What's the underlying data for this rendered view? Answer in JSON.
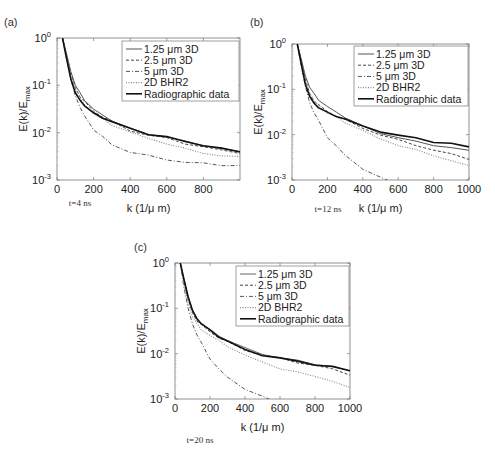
{
  "figure": {
    "panels": [
      {
        "label": "(a)",
        "caption": "t=4 ns"
      },
      {
        "label": "(b)",
        "caption": "t=12 ns"
      },
      {
        "label": "(c)",
        "caption": "t=20 ns"
      }
    ]
  },
  "chart_data": [
    {
      "type": "line",
      "title": "(a)",
      "caption": "t=4 ns",
      "xlabel": "k (1/μ m)",
      "ylabel": "E(k)/E_max",
      "xscale": "linear",
      "yscale": "log",
      "xlim": [
        0,
        1000
      ],
      "ylim": [
        0.001,
        1
      ],
      "xticks": [
        0,
        200,
        400,
        600,
        800
      ],
      "yticks": [
        "10^-3",
        "10^-2",
        "10^-1",
        "10^0"
      ],
      "grid": false,
      "legend_position": "upper right",
      "x": [
        30,
        50,
        75,
        100,
        125,
        150,
        200,
        250,
        300,
        400,
        500,
        600,
        700,
        800,
        900,
        1000
      ],
      "series": [
        {
          "name": "1.25 μm 3D",
          "style": "solid",
          "color": "#555555",
          "values": [
            1.0,
            0.5,
            0.2,
            0.1,
            0.07,
            0.05,
            0.03,
            0.024,
            0.018,
            0.012,
            0.0095,
            0.008,
            0.0065,
            0.0055,
            0.0045,
            0.004
          ]
        },
        {
          "name": "2.5 μm 3D",
          "style": "dashed",
          "color": "#444444",
          "values": [
            1.0,
            0.45,
            0.18,
            0.09,
            0.06,
            0.045,
            0.028,
            0.022,
            0.017,
            0.011,
            0.009,
            0.0075,
            0.006,
            0.005,
            0.0042,
            0.0038
          ]
        },
        {
          "name": "5 μm 3D",
          "style": "dashdot",
          "color": "#555555",
          "values": [
            1.0,
            0.4,
            0.14,
            0.06,
            0.035,
            0.022,
            0.012,
            0.008,
            0.0055,
            0.004,
            0.0032,
            0.0027,
            0.0024,
            0.0022,
            0.0021,
            0.002
          ]
        },
        {
          "name": "2D BHR2",
          "style": "dotted",
          "color": "#888888",
          "values": [
            1.0,
            0.45,
            0.17,
            0.085,
            0.055,
            0.04,
            0.025,
            0.019,
            0.015,
            0.01,
            0.0075,
            0.006,
            0.0045,
            0.0037,
            0.0033,
            0.003
          ]
        },
        {
          "name": "Radiographic data",
          "style": "solid-thick",
          "color": "#111111",
          "values": [
            1.0,
            0.4,
            0.14,
            0.07,
            0.05,
            0.038,
            0.025,
            0.021,
            0.017,
            0.012,
            0.0095,
            0.008,
            0.0065,
            0.0055,
            0.0045,
            0.004
          ]
        }
      ]
    },
    {
      "type": "line",
      "title": "(b)",
      "caption": "t=12 ns",
      "xlabel": "k (1/μ m)",
      "ylabel": "E(k)/E_max",
      "xscale": "linear",
      "yscale": "log",
      "xlim": [
        0,
        1000
      ],
      "ylim": [
        0.001,
        1
      ],
      "xticks": [
        0,
        200,
        400,
        600,
        800,
        1000
      ],
      "yticks": [
        "10^-3",
        "10^-2",
        "10^-1",
        "10^0"
      ],
      "grid": false,
      "legend_position": "upper right",
      "x": [
        30,
        50,
        75,
        100,
        125,
        150,
        200,
        250,
        300,
        400,
        500,
        600,
        700,
        800,
        900,
        1000
      ],
      "series": [
        {
          "name": "1.25 μm 3D",
          "style": "solid",
          "color": "#555555",
          "values": [
            1.0,
            0.5,
            0.2,
            0.11,
            0.08,
            0.06,
            0.04,
            0.032,
            0.024,
            0.015,
            0.011,
            0.0085,
            0.007,
            0.006,
            0.005,
            0.0045
          ]
        },
        {
          "name": "2.5 μm 3D",
          "style": "dashed",
          "color": "#444444",
          "values": [
            1.0,
            0.45,
            0.17,
            0.08,
            0.055,
            0.045,
            0.032,
            0.026,
            0.021,
            0.014,
            0.01,
            0.0075,
            0.006,
            0.0045,
            0.0037,
            0.003
          ]
        },
        {
          "name": "5 μm 3D",
          "style": "dashdot",
          "color": "#555555",
          "values": [
            1.0,
            0.35,
            0.12,
            0.05,
            0.03,
            0.02,
            0.009,
            0.0055,
            0.0035,
            0.0018,
            0.0011,
            0.0008,
            0.0006,
            0.00045,
            0.00035,
            0.0003
          ]
        },
        {
          "name": "2D BHR2",
          "style": "dotted",
          "color": "#888888",
          "values": [
            1.0,
            0.45,
            0.17,
            0.08,
            0.055,
            0.045,
            0.03,
            0.024,
            0.019,
            0.012,
            0.008,
            0.006,
            0.0045,
            0.0035,
            0.0027,
            0.002
          ]
        },
        {
          "name": "Radiographic data",
          "style": "solid-thick",
          "color": "#111111",
          "values": [
            1.0,
            0.4,
            0.13,
            0.07,
            0.05,
            0.04,
            0.03,
            0.026,
            0.022,
            0.015,
            0.012,
            0.0095,
            0.0085,
            0.007,
            0.0062,
            0.0055
          ]
        }
      ]
    },
    {
      "type": "line",
      "title": "(c)",
      "caption": "t=20 ns",
      "xlabel": "k (1/μ m)",
      "ylabel": "E(k)/E_max",
      "xscale": "linear",
      "yscale": "log",
      "xlim": [
        0,
        1000
      ],
      "ylim": [
        0.001,
        1
      ],
      "xticks": [
        0,
        200,
        400,
        600,
        800,
        1000
      ],
      "yticks": [
        "10^-3",
        "10^-2",
        "10^-1",
        "10^0"
      ],
      "grid": false,
      "legend_position": "upper right",
      "x": [
        30,
        50,
        75,
        100,
        125,
        150,
        200,
        250,
        300,
        400,
        500,
        600,
        700,
        800,
        900,
        1000
      ],
      "series": [
        {
          "name": "1.25 μm 3D",
          "style": "solid",
          "color": "#666666",
          "values": [
            1.0,
            0.45,
            0.18,
            0.09,
            0.06,
            0.047,
            0.033,
            0.025,
            0.02,
            0.013,
            0.01,
            0.008,
            0.007,
            0.006,
            0.005,
            0.0042
          ]
        },
        {
          "name": "2.5 μm 3D",
          "style": "dashed",
          "color": "#444444",
          "values": [
            1.0,
            0.42,
            0.16,
            0.08,
            0.055,
            0.043,
            0.03,
            0.023,
            0.018,
            0.012,
            0.0095,
            0.0078,
            0.0065,
            0.0055,
            0.0045,
            0.0035
          ]
        },
        {
          "name": "5 μm 3D",
          "style": "dashdot",
          "color": "#555555",
          "values": [
            1.0,
            0.3,
            0.1,
            0.045,
            0.026,
            0.017,
            0.008,
            0.0045,
            0.003,
            0.0017,
            0.0011,
            0.0008,
            0.0006,
            0.0005,
            0.0004,
            0.00035
          ]
        },
        {
          "name": "2D BHR2",
          "style": "dotted",
          "color": "#888888",
          "values": [
            1.0,
            0.35,
            0.13,
            0.065,
            0.045,
            0.035,
            0.025,
            0.019,
            0.015,
            0.009,
            0.0065,
            0.0048,
            0.0038,
            0.0032,
            0.0025,
            0.0017
          ]
        },
        {
          "name": "Radiographic data",
          "style": "solid-thick",
          "color": "#111111",
          "values": [
            1.0,
            0.45,
            0.18,
            0.09,
            0.06,
            0.047,
            0.032,
            0.024,
            0.019,
            0.012,
            0.0095,
            0.0078,
            0.0068,
            0.0058,
            0.005,
            0.0043
          ]
        }
      ]
    }
  ]
}
